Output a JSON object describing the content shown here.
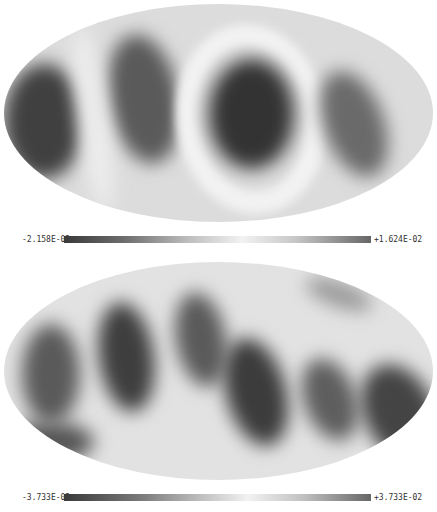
{
  "panels": [
    {
      "name": "top-map",
      "projection": "mollweide",
      "colorbar": {
        "min_label": "-2.158E-02",
        "max_label": "+1.624E-02"
      }
    },
    {
      "name": "bottom-map",
      "projection": "mollweide",
      "colorbar": {
        "min_label": "-3.733E-02",
        "max_label": "+3.733E-02"
      }
    }
  ],
  "colors": {
    "dark": "#3a3a3a",
    "light": "#f0f0f0",
    "mid": "#bdbdbd"
  }
}
